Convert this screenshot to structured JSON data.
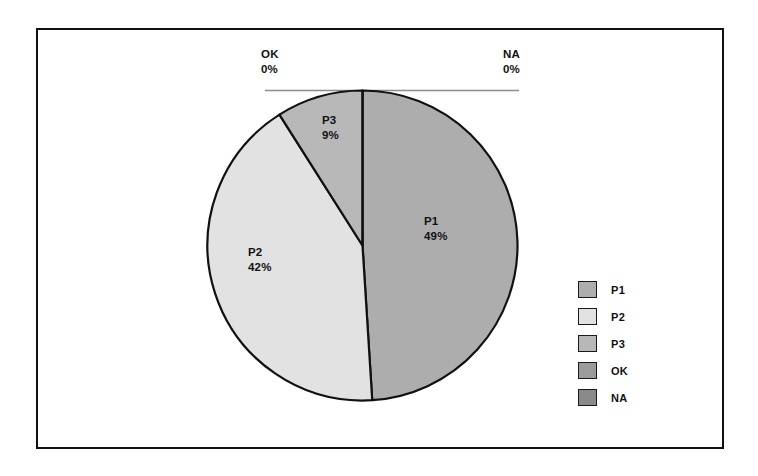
{
  "chart_data": {
    "type": "pie",
    "title": "",
    "categories": [
      "P1",
      "P2",
      "P3",
      "OK",
      "NA"
    ],
    "values": [
      49,
      42,
      9,
      0,
      0
    ],
    "value_unit": "%",
    "labels": [
      {
        "name": "P1",
        "value": "49%"
      },
      {
        "name": "P2",
        "value": "42%"
      },
      {
        "name": "P3",
        "value": "9%"
      },
      {
        "name": "OK",
        "value": "0%"
      },
      {
        "name": "NA",
        "value": "0%"
      }
    ],
    "colors": [
      "#adadad",
      "#e2e2e2",
      "#b8b8b8",
      "#9b9b9b",
      "#8a8a8a"
    ],
    "slice_outline_color": "#111111",
    "start_angle_deg": 0,
    "direction": "clockwise",
    "legend": {
      "position": "right",
      "entries": [
        {
          "label": "P1",
          "color": "#adadad"
        },
        {
          "label": "P2",
          "color": "#e2e2e2"
        },
        {
          "label": "P3",
          "color": "#b8b8b8"
        },
        {
          "label": "OK",
          "color": "#9b9b9b"
        },
        {
          "label": "NA",
          "color": "#8a8a8a"
        }
      ]
    },
    "leader_lines": true,
    "grid": false,
    "xlabel": "",
    "ylabel": ""
  },
  "frame": {
    "border_color": "#111111"
  }
}
